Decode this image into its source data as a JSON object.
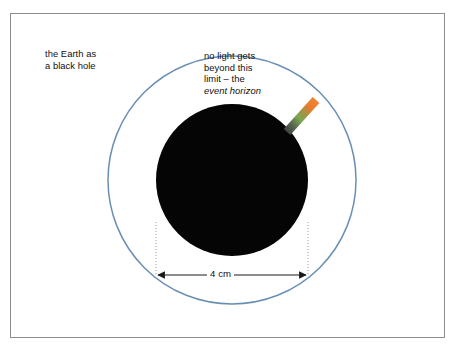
{
  "figure": {
    "background_color": "#ffffff",
    "frame_color": "#8d8d8d"
  },
  "labels": {
    "earth_caption": "the Earth as\na black hole",
    "horizon_caption_lines": [
      "no light gets",
      "beyond this",
      "limit – the"
    ],
    "horizon_caption_line1": "no light gets",
    "horizon_caption_line2": "beyond this",
    "horizon_caption_line3": "limit – the",
    "horizon_caption_emphasis": "event horizon"
  },
  "dimension": {
    "value": "4 cm",
    "arrow_style": "double-headed",
    "measures": "diameter of the black hole disc"
  },
  "shapes": {
    "event_horizon_circle": {
      "name": "event-horizon-circle",
      "center_x": 232,
      "center_y": 180,
      "radius": 124,
      "stroke": "#6a8fb5",
      "stroke_width": 1.5,
      "fill": "none"
    },
    "black_hole_disc": {
      "name": "black-hole-disc",
      "center_x": 232,
      "center_y": 180,
      "radius": 76,
      "fill": "#050505"
    },
    "light_streak": {
      "name": "light-streak",
      "inner_color": "#4d5357",
      "middle_color": "#7aa84f",
      "outer_color": "#ea7b2d",
      "x1": 288,
      "y1": 131,
      "x2": 317,
      "y2": 99
    },
    "guide_lines": {
      "left_x": 156,
      "right_x": 308,
      "top_y": 225,
      "bottom_y": 275,
      "color": "#9a9a9a",
      "dash": "1 2"
    },
    "dimension_arrow": {
      "y": 275,
      "x_start": 156,
      "x_end": 308,
      "color": "#1a1a1a"
    }
  }
}
